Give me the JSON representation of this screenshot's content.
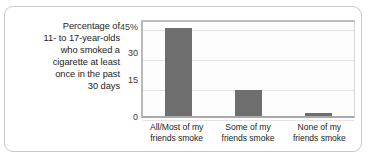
{
  "chart_data": {
    "type": "bar",
    "title": "",
    "subtitle": "",
    "xlabel": "",
    "ylabel": "Percentage of\n11- to 17-year-olds\nwho smoked a\ncigarette at least\nonce in the past\n30 days",
    "categories": [
      "All/Most of my\nfriends smoke",
      "Some of my\nfriends smoke",
      "None of my\nfriends smoke"
    ],
    "values": [
      44,
      13,
      1.5
    ],
    "ylim": [
      0,
      49
    ],
    "yticks": [
      45,
      30,
      15,
      0
    ],
    "ytick_labels": [
      "45%",
      "30",
      "15",
      "0"
    ],
    "grid": true,
    "legend": "none",
    "colors": {
      "bar": "#6e6e6e",
      "gridline": "#e3e3e3",
      "axis": "#b0b0b0",
      "text": "#1d1d1b",
      "frame": "#c9c9c9",
      "plot_background": "#fdfdfd",
      "page_background": "#ffffff"
    }
  }
}
